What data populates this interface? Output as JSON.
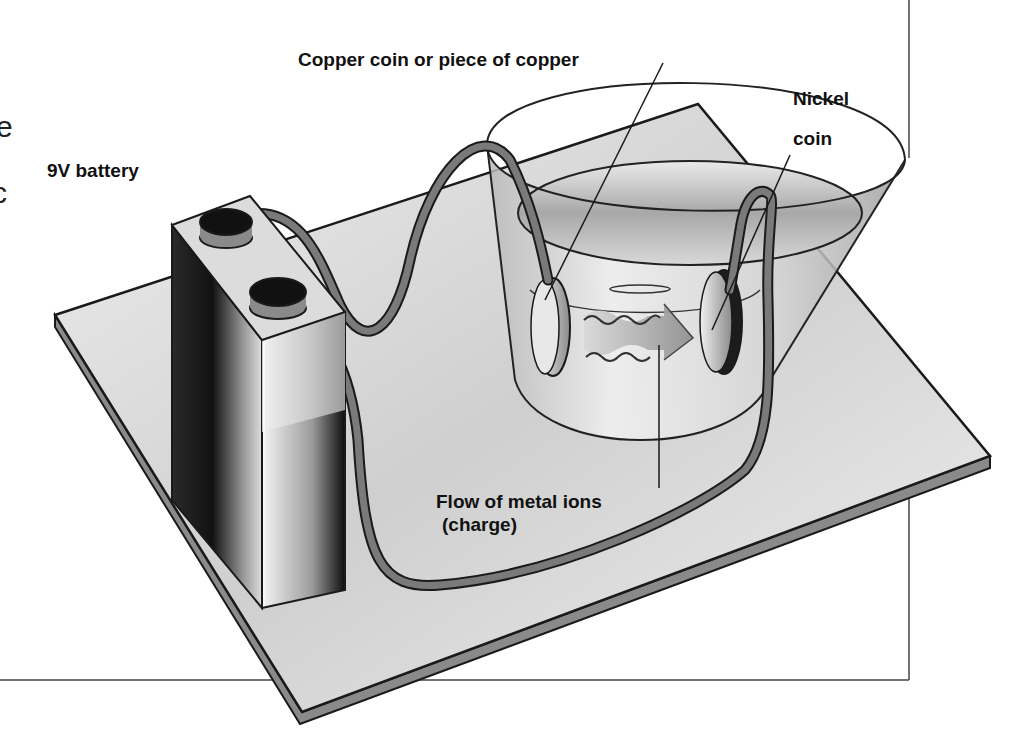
{
  "diagram": {
    "labels": {
      "battery": "9V battery",
      "copper": "Copper coin or piece of copper",
      "nickel_line1": "Nickel",
      "nickel_line2": "coin",
      "flow_line1": "Flow of metal ions",
      "flow_line2": "(charge)"
    },
    "clipped_text_fragments": [
      "e",
      "c"
    ],
    "colors": {
      "board_top": "#d8d8d8",
      "board_edge": "#8a8a8a",
      "wire": "#7a7a7a",
      "outline": "#1a1a1a",
      "battery_dark": "#1c1c1c",
      "battery_light": "#e6e6e6",
      "liquid": "#c8c8c8",
      "frame_line": "#444444"
    },
    "components": [
      "9V battery",
      "wire",
      "beaker with electrolyte",
      "copper electrode",
      "nickel electrode",
      "ion flow arrow",
      "base board"
    ]
  }
}
